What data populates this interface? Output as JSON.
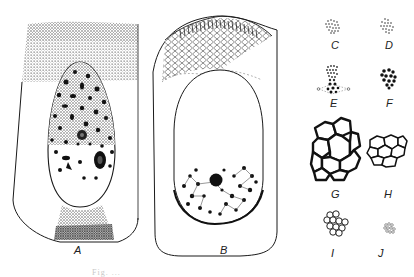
{
  "figure": {
    "panels": [
      {
        "id": "A",
        "label": "A",
        "description": "Cell with dense stippled apical zone, oval nucleus with dark granules, and stippled basal zone"
      },
      {
        "id": "B",
        "label": "B",
        "description": "Cell with striated/reticulated apical zone and large oval clear region with granular basal cluster"
      },
      {
        "id": "C",
        "label": "C",
        "description": "Fine dotted cluster"
      },
      {
        "id": "D",
        "label": "D",
        "description": "Fine dotted cluster"
      },
      {
        "id": "E",
        "label": "E",
        "description": "Dotted cluster with dark granules and dashed spindle",
        "sublabels": [
          "a",
          "a"
        ]
      },
      {
        "id": "F",
        "label": "F",
        "description": "Dark granular cluster"
      },
      {
        "id": "G",
        "label": "G",
        "description": "Large thick-walled polygonal cells"
      },
      {
        "id": "H",
        "label": "H",
        "description": "Medium polygonal cells"
      },
      {
        "id": "I",
        "label": "I",
        "description": "Small round cells"
      },
      {
        "id": "J",
        "label": "J",
        "description": "Tiny dotted cluster"
      }
    ],
    "caption": "Fig. ..."
  },
  "colors": {
    "ink": "#1a1a1a",
    "stipple": "#8a8a8a",
    "stipple_dark": "#5c5c5c",
    "paper": "#ffffff"
  }
}
